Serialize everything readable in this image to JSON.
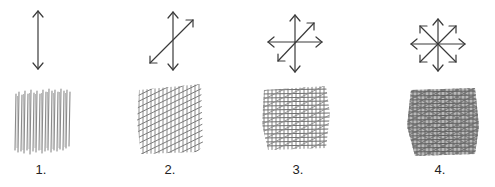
{
  "figure": {
    "stroke_color": "#3a3a3a",
    "panels": [
      {
        "label": "1.",
        "directions": [
          "vertical"
        ]
      },
      {
        "label": "2.",
        "directions": [
          "vertical",
          "diagonal"
        ]
      },
      {
        "label": "3.",
        "directions": [
          "vertical",
          "horizontal",
          "diagonal"
        ]
      },
      {
        "label": "4.",
        "directions": [
          "vertical",
          "horizontal",
          "diagonal",
          "anti-diagonal"
        ]
      }
    ]
  }
}
